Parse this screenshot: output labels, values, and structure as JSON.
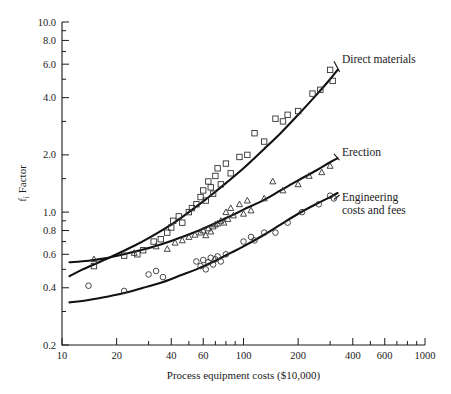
{
  "chart_data": {
    "type": "scatter",
    "title": "",
    "xlabel": "Process equipment costs ($10,000)",
    "ylabel": "fᵢ Factor",
    "xscale": "log",
    "yscale": "log",
    "xlim": [
      10,
      1000
    ],
    "ylim": [
      0.2,
      10.0
    ],
    "grid": false,
    "legend_position": "inline-right-annotations",
    "xticks": [
      10,
      20,
      40,
      60,
      100,
      200,
      400,
      600,
      1000
    ],
    "xtick_labels": [
      "10",
      "20",
      "40",
      "60",
      "100",
      "200",
      "400",
      "600",
      "1000"
    ],
    "yticks": [
      0.2,
      0.4,
      0.6,
      0.8,
      1.0,
      2.0,
      4.0,
      6.0,
      8.0,
      10.0
    ],
    "ytick_labels": [
      "0.2",
      "0.4",
      "0.6",
      "0.8",
      "1.0",
      "2.0",
      "4.0",
      "6.0",
      "8.0",
      "10.0"
    ],
    "yminor_ticks": [
      0.3,
      0.5,
      0.7,
      0.9,
      1.5,
      3.0,
      5.0,
      7.0,
      9.0
    ],
    "xminor_ticks": [
      30,
      50,
      70,
      80,
      90,
      300,
      500,
      700,
      800,
      900
    ],
    "series": [
      {
        "name": "Direct materials",
        "marker": "square",
        "annotation": "Direct materials",
        "annotation_x": 340,
        "annotation_y": 6.3,
        "curve": [
          [
            11,
            0.46
          ],
          [
            13,
            0.5
          ],
          [
            16,
            0.545
          ],
          [
            20,
            0.6
          ],
          [
            25,
            0.665
          ],
          [
            30,
            0.73
          ],
          [
            40,
            0.86
          ],
          [
            50,
            1.0
          ],
          [
            60,
            1.14
          ],
          [
            70,
            1.28
          ],
          [
            80,
            1.42
          ],
          [
            100,
            1.7
          ],
          [
            130,
            2.15
          ],
          [
            160,
            2.6
          ],
          [
            200,
            3.25
          ],
          [
            250,
            4.1
          ],
          [
            300,
            5.0
          ],
          [
            330,
            5.6
          ]
        ],
        "points": [
          [
            15,
            0.52
          ],
          [
            22,
            0.59
          ],
          [
            26,
            0.6
          ],
          [
            28,
            0.63
          ],
          [
            32,
            0.7
          ],
          [
            35,
            0.72
          ],
          [
            38,
            0.78
          ],
          [
            40,
            0.83
          ],
          [
            41,
            0.9
          ],
          [
            44,
            0.95
          ],
          [
            46,
            0.88
          ],
          [
            50,
            1.0
          ],
          [
            52,
            1.05
          ],
          [
            55,
            1.1
          ],
          [
            58,
            1.2
          ],
          [
            60,
            1.3
          ],
          [
            62,
            1.15
          ],
          [
            64,
            1.45
          ],
          [
            66,
            1.35
          ],
          [
            68,
            1.25
          ],
          [
            70,
            1.55
          ],
          [
            72,
            1.7
          ],
          [
            75,
            1.4
          ],
          [
            80,
            1.8
          ],
          [
            85,
            1.6
          ],
          [
            95,
            1.95
          ],
          [
            105,
            2.0
          ],
          [
            115,
            2.6
          ],
          [
            130,
            2.35
          ],
          [
            150,
            3.1
          ],
          [
            165,
            3.0
          ],
          [
            175,
            3.25
          ],
          [
            200,
            3.4
          ],
          [
            240,
            4.2
          ],
          [
            265,
            4.4
          ],
          [
            300,
            5.6
          ],
          [
            310,
            4.9
          ]
        ]
      },
      {
        "name": "Erection",
        "marker": "triangle",
        "annotation": "Erection",
        "annotation_x": 340,
        "annotation_y": 2.05,
        "curve": [
          [
            11,
            0.545
          ],
          [
            14,
            0.555
          ],
          [
            18,
            0.575
          ],
          [
            22,
            0.6
          ],
          [
            28,
            0.635
          ],
          [
            35,
            0.675
          ],
          [
            45,
            0.735
          ],
          [
            55,
            0.79
          ],
          [
            70,
            0.875
          ],
          [
            85,
            0.955
          ],
          [
            100,
            1.03
          ],
          [
            130,
            1.16
          ],
          [
            160,
            1.3
          ],
          [
            200,
            1.47
          ],
          [
            250,
            1.65
          ],
          [
            300,
            1.83
          ],
          [
            330,
            1.92
          ]
        ],
        "points": [
          [
            15,
            0.565
          ],
          [
            25,
            0.61
          ],
          [
            33,
            0.66
          ],
          [
            38,
            0.64
          ],
          [
            42,
            0.69
          ],
          [
            46,
            0.71
          ],
          [
            50,
            0.74
          ],
          [
            54,
            0.76
          ],
          [
            58,
            0.78
          ],
          [
            60,
            0.8
          ],
          [
            62,
            0.755
          ],
          [
            64,
            0.82
          ],
          [
            66,
            0.79
          ],
          [
            68,
            0.84
          ],
          [
            70,
            0.86
          ],
          [
            72,
            0.87
          ],
          [
            75,
            0.9
          ],
          [
            78,
            0.88
          ],
          [
            80,
            1.0
          ],
          [
            82,
            0.92
          ],
          [
            85,
            1.05
          ],
          [
            88,
            0.96
          ],
          [
            95,
            1.1
          ],
          [
            100,
            0.98
          ],
          [
            105,
            1.15
          ],
          [
            110,
            1.02
          ],
          [
            130,
            1.18
          ],
          [
            145,
            1.45
          ],
          [
            165,
            1.3
          ],
          [
            200,
            1.4
          ],
          [
            230,
            1.55
          ],
          [
            270,
            1.62
          ],
          [
            300,
            1.75
          ]
        ]
      },
      {
        "name": "Engineering costs and fees",
        "marker": "circle",
        "annotation": "Engineering",
        "annotation2": "costs and fees",
        "annotation_x": 340,
        "annotation_y": 1.18,
        "curve": [
          [
            11,
            0.335
          ],
          [
            14,
            0.345
          ],
          [
            18,
            0.36
          ],
          [
            22,
            0.375
          ],
          [
            28,
            0.4
          ],
          [
            35,
            0.425
          ],
          [
            45,
            0.465
          ],
          [
            55,
            0.5
          ],
          [
            70,
            0.555
          ],
          [
            85,
            0.61
          ],
          [
            100,
            0.66
          ],
          [
            130,
            0.76
          ],
          [
            160,
            0.86
          ],
          [
            200,
            0.98
          ],
          [
            250,
            1.1
          ],
          [
            300,
            1.2
          ],
          [
            330,
            1.26
          ]
        ],
        "points": [
          [
            14,
            0.41
          ],
          [
            22,
            0.385
          ],
          [
            30,
            0.47
          ],
          [
            33,
            0.49
          ],
          [
            36,
            0.455
          ],
          [
            55,
            0.55
          ],
          [
            58,
            0.52
          ],
          [
            60,
            0.56
          ],
          [
            62,
            0.5
          ],
          [
            64,
            0.545
          ],
          [
            66,
            0.575
          ],
          [
            68,
            0.53
          ],
          [
            70,
            0.565
          ],
          [
            72,
            0.585
          ],
          [
            75,
            0.55
          ],
          [
            80,
            0.6
          ],
          [
            100,
            0.7
          ],
          [
            110,
            0.74
          ],
          [
            115,
            0.71
          ],
          [
            130,
            0.78
          ],
          [
            150,
            0.78
          ],
          [
            175,
            0.88
          ],
          [
            210,
            1.0
          ],
          [
            260,
            1.1
          ],
          [
            300,
            1.22
          ],
          [
            315,
            1.18
          ]
        ]
      }
    ]
  },
  "axes": {
    "y_label_text": "f",
    "y_label_sub": "i",
    "y_label_tail": " Factor"
  }
}
